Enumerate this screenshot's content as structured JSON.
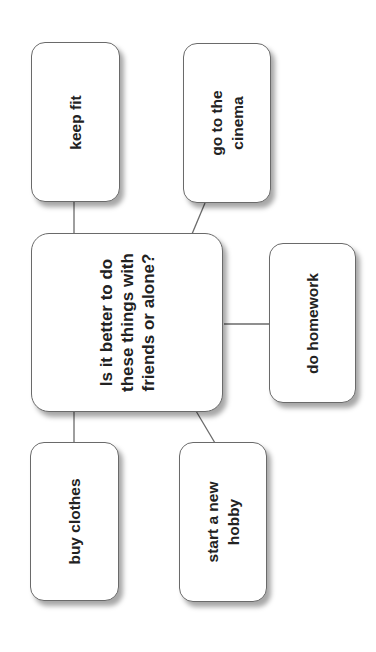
{
  "diagram": {
    "type": "mind-map",
    "orientation": "rotated-90-ccw",
    "central": {
      "text": "Is it better to do\nthese things with\nfriends or alone?"
    },
    "nodes": [
      {
        "id": "keep_fit",
        "text": "keep fit"
      },
      {
        "id": "cinema",
        "text": "go to the\ncinema"
      },
      {
        "id": "homework",
        "text": "do homework"
      },
      {
        "id": "buy_clothes",
        "text": "buy clothes"
      },
      {
        "id": "hobby",
        "text": "start a new\nhobby"
      }
    ],
    "colors": {
      "border": "#6a6a6a",
      "line": "#6a6a6a",
      "text": "#222222",
      "background": "#ffffff"
    }
  }
}
